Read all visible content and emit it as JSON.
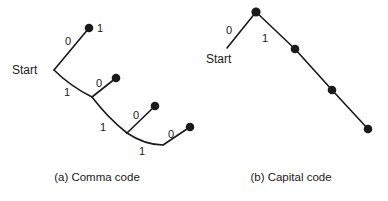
{
  "figure": {
    "background": "#ffffff",
    "ink_color": "#1a1a1a"
  },
  "panels": [
    {
      "id": "comma-code",
      "caption": "(a) Comma code",
      "start_label": "Start",
      "description": "Binary code tree where each codeword is a run of 1s terminated by a 0",
      "nodes": [
        {
          "id": "root",
          "x": 54,
          "y": 70,
          "terminal": false
        },
        {
          "id": "leaf1",
          "x": 89,
          "y": 28,
          "terminal": true
        },
        {
          "id": "branch2",
          "x": 92,
          "y": 97,
          "terminal": false
        },
        {
          "id": "leaf2",
          "x": 116,
          "y": 78,
          "terminal": true
        },
        {
          "id": "branch3",
          "x": 127,
          "y": 133,
          "terminal": false
        },
        {
          "id": "leaf3",
          "x": 155,
          "y": 106,
          "terminal": true
        },
        {
          "id": "branch4",
          "x": 163,
          "y": 145,
          "terminal": false
        },
        {
          "id": "leaf4",
          "x": 190,
          "y": 127,
          "terminal": true
        }
      ],
      "edges": [
        {
          "from": "root",
          "to": "leaf1",
          "bit": "0",
          "bit_x": 68,
          "bit_y": 45
        },
        {
          "from": "root",
          "to": "branch2",
          "bit": "1",
          "bit_x": 67,
          "bit_y": 96
        },
        {
          "from": "branch2",
          "to": "leaf2",
          "bit": "0",
          "bit_x": 99,
          "bit_y": 87
        },
        {
          "from": "branch2",
          "to": "branch3",
          "bit": "1",
          "bit_x": 103,
          "bit_y": 131
        },
        {
          "from": "branch3",
          "to": "leaf3",
          "bit": "0",
          "bit_x": 136,
          "bit_y": 119
        },
        {
          "from": "branch3",
          "to": "branch4",
          "bit": "1",
          "bit_x": 142,
          "bit_y": 155
        },
        {
          "from": "branch4",
          "to": "leaf4",
          "bit": "0",
          "bit_x": 171,
          "bit_y": 138
        }
      ],
      "annotations": [
        {
          "text": "1",
          "x": 100,
          "y": 32
        }
      ],
      "start_label_x": 12,
      "start_label_y": 74
    },
    {
      "id": "capital-code",
      "caption": "(b) Capital code",
      "start_label": "Start",
      "description": "Binary code tree where the first symbol is 0 and all others are runs of 1s",
      "nodes": [
        {
          "id": "apex",
          "x": 256,
          "y": 12,
          "terminal": true
        },
        {
          "id": "chain1",
          "x": 295,
          "y": 49,
          "terminal": true
        },
        {
          "id": "chain2",
          "x": 332,
          "y": 90,
          "terminal": true
        },
        {
          "id": "chain3",
          "x": 368,
          "y": 129,
          "terminal": true
        }
      ],
      "edges": [
        {
          "from": "apex",
          "to": "start-stub",
          "bit": "0",
          "bit_x": 229,
          "bit_y": 34
        },
        {
          "from": "apex",
          "to": "chain1",
          "bit": "1",
          "bit_x": 265,
          "bit_y": 42
        },
        {
          "from": "chain1",
          "to": "chain2",
          "bit": "",
          "bit_x": 0,
          "bit_y": 0
        },
        {
          "from": "chain2",
          "to": "chain3",
          "bit": "",
          "bit_x": 0,
          "bit_y": 0
        }
      ],
      "start_stub": {
        "x1": 256,
        "y1": 12,
        "x2": 227,
        "y2": 48
      },
      "start_label_x": 206,
      "start_label_y": 63
    }
  ]
}
